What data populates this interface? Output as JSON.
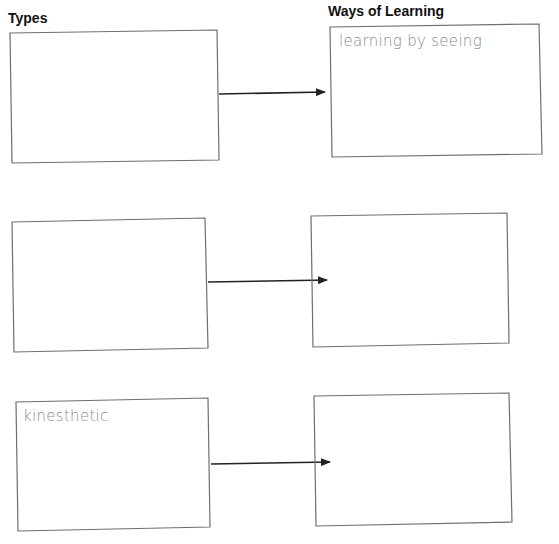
{
  "headings": {
    "types": "Types",
    "ways": "Ways of Learning"
  },
  "rows": [
    {
      "type_text": "",
      "way_text": "learning by seeing"
    },
    {
      "type_text": "",
      "way_text": ""
    },
    {
      "type_text": "kinesthetic",
      "way_text": ""
    }
  ],
  "colors": {
    "box_border": "#6e6e6e",
    "arrow": "#222222",
    "handwriting": "#8a8a8a"
  }
}
